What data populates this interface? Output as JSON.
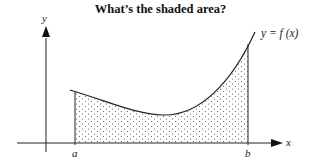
{
  "title": "What’s the shaded area?",
  "diagram": {
    "y_axis_label": "y",
    "x_axis_label": "x",
    "curve_label": "y = f (x)",
    "left_bound_label": "a",
    "right_bound_label": "b",
    "shading": "dotted region under curve between a and b",
    "colors": {
      "line": "#222222",
      "dots": "#555555",
      "background": "#ffffff"
    }
  }
}
